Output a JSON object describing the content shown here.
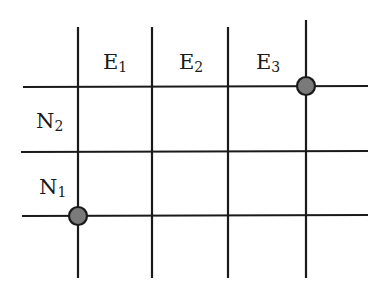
{
  "diagram": {
    "type": "grid",
    "columns": [
      {
        "label": "E",
        "subscript": "1"
      },
      {
        "label": "E",
        "subscript": "2"
      },
      {
        "label": "E",
        "subscript": "3"
      }
    ],
    "rows": [
      {
        "label": "N",
        "subscript": "2"
      },
      {
        "label": "N",
        "subscript": "1"
      }
    ],
    "vertical_lines_x": [
      78,
      152,
      228,
      306
    ],
    "horizontal_lines_y": [
      87,
      152,
      216
    ],
    "highlighted_points": [
      {
        "name": "top-right-point",
        "x": 306,
        "y": 86,
        "color": "#7a7a7a"
      },
      {
        "name": "bottom-left-point",
        "x": 78,
        "y": 216,
        "color": "#7a7a7a"
      }
    ],
    "line_color": "#1a1a1a"
  }
}
